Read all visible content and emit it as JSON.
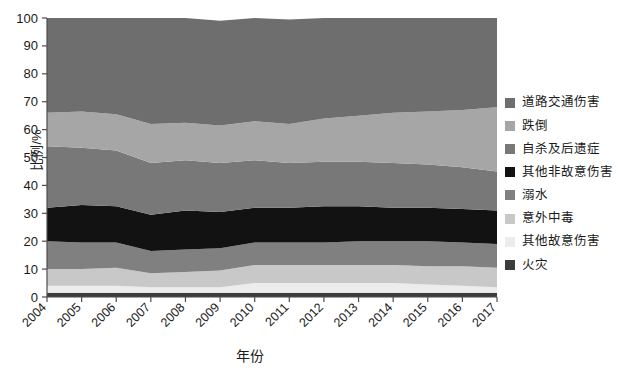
{
  "chart_data": {
    "type": "area",
    "stacked": true,
    "percent": true,
    "title": "",
    "xlabel": "年份",
    "ylabel": "比例/%",
    "grid": false,
    "legend_position": "right",
    "ylim": [
      0,
      100
    ],
    "yticks": [
      0,
      10,
      20,
      30,
      40,
      50,
      60,
      70,
      80,
      90,
      100
    ],
    "categories": [
      "2004",
      "2005",
      "2006",
      "2007",
      "2008",
      "2009",
      "2010",
      "2011",
      "2012",
      "2013",
      "2014",
      "2015",
      "2016",
      "2017"
    ],
    "series": [
      {
        "name": "道路交通伤害",
        "color": "#6e6e6e",
        "values": [
          34.0,
          33.5,
          34.5,
          38.0,
          37.5,
          37.5,
          37.0,
          37.5,
          36.0,
          35.0,
          34.0,
          33.5,
          33.0,
          32.0
        ]
      },
      {
        "name": "跌倒",
        "color": "#a6a6a6",
        "values": [
          12.0,
          13.0,
          13.0,
          14.0,
          13.5,
          13.5,
          14.0,
          14.0,
          15.5,
          16.5,
          18.0,
          19.0,
          20.5,
          23.0
        ]
      },
      {
        "name": "自杀及后遗症",
        "color": "#787878",
        "values": [
          22.0,
          20.5,
          20.0,
          18.5,
          18.0,
          17.5,
          17.0,
          16.0,
          16.0,
          16.0,
          16.0,
          15.5,
          15.0,
          14.0
        ]
      },
      {
        "name": "其他非故意伤害",
        "color": "#121212",
        "values": [
          12.0,
          13.5,
          13.0,
          13.0,
          14.0,
          13.0,
          12.5,
          12.5,
          13.0,
          12.5,
          12.0,
          12.0,
          12.0,
          12.0
        ]
      },
      {
        "name": "溺水",
        "color": "#808080",
        "values": [
          10.0,
          9.5,
          9.0,
          8.0,
          8.0,
          8.0,
          8.0,
          8.0,
          8.0,
          8.5,
          8.5,
          9.0,
          8.5,
          8.5
        ]
      },
      {
        "name": "意外中毒",
        "color": "#c8c8c8",
        "values": [
          6.0,
          6.0,
          6.5,
          5.0,
          5.5,
          6.0,
          6.5,
          6.5,
          6.5,
          6.5,
          6.5,
          6.5,
          7.0,
          7.0
        ]
      },
      {
        "name": "其他故意伤害",
        "color": "#ececec",
        "values": [
          2.5,
          2.5,
          2.5,
          2.0,
          2.0,
          2.0,
          3.5,
          3.5,
          3.5,
          3.5,
          3.5,
          3.0,
          2.5,
          2.0
        ]
      },
      {
        "name": "火灾",
        "color": "#3c3c3c",
        "values": [
          1.5,
          1.5,
          1.5,
          1.5,
          1.5,
          1.5,
          1.5,
          1.5,
          1.5,
          1.5,
          1.5,
          1.5,
          1.5,
          1.5
        ]
      }
    ]
  },
  "axes": {
    "y_title": "比例/%",
    "x_title": "年份"
  }
}
